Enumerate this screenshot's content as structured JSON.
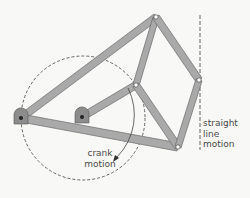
{
  "diagram": {
    "colors": {
      "background": "#f8f8f6",
      "link_fill": "#a9a9a9",
      "link_stroke": "#6a6a6a",
      "pivot_fill": "#8c8c8c",
      "joint_fill": "#ffffff",
      "dashed": "#555555",
      "text": "#4a4a4a"
    },
    "joints": {
      "A_fixed_pivot": {
        "x": 21,
        "y": 118
      },
      "B_fixed_pivot": {
        "x": 82,
        "y": 117
      },
      "C_top": {
        "x": 156,
        "y": 17
      },
      "D_mid": {
        "x": 136,
        "y": 85
      },
      "E_right": {
        "x": 199,
        "y": 80
      },
      "F_bottom": {
        "x": 178,
        "y": 147
      }
    },
    "links": [
      {
        "from": "A_fixed_pivot",
        "to": "C_top"
      },
      {
        "from": "A_fixed_pivot",
        "to": "F_bottom"
      },
      {
        "from": "B_fixed_pivot",
        "to": "D_mid"
      },
      {
        "from": "C_top",
        "to": "D_mid"
      },
      {
        "from": "C_top",
        "to": "E_right"
      },
      {
        "from": "D_mid",
        "to": "F_bottom"
      },
      {
        "from": "E_right",
        "to": "F_bottom"
      }
    ],
    "dashed_circle": {
      "cx": 83,
      "cy": 118,
      "r": 62
    },
    "straight_line_path": {
      "x": 200,
      "y1": 15,
      "y2": 150
    },
    "labels": {
      "crank_line1": "crank",
      "crank_line2": "motion",
      "straight_line1": "straight",
      "straight_line2": "line",
      "straight_line3": "motion"
    }
  }
}
